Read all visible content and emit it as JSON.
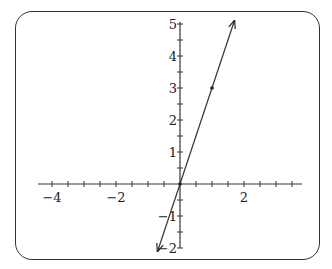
{
  "chart_data": {
    "type": "line",
    "title": "",
    "xlabel": "",
    "ylabel": "",
    "xlim": [
      -4.5,
      3.75
    ],
    "ylim": [
      -2.1,
      5.1
    ],
    "grid": false,
    "x_tick_labels": [
      "-4",
      "-2",
      "2"
    ],
    "y_tick_labels": [
      "5",
      "4",
      "3",
      "2",
      "1",
      "-1",
      "-2"
    ],
    "minor_tick_step": 0.5,
    "series": [
      {
        "name": "y = 3x",
        "equation": "y = 3x",
        "slope": 3,
        "intercept": 0,
        "x": [
          -0.7,
          1.7
        ],
        "y": [
          -2.1,
          5.1
        ],
        "arrows_both_ends": true
      }
    ],
    "points": [
      {
        "x": 0,
        "y": 0
      },
      {
        "x": 1,
        "y": 3
      }
    ],
    "legend": null
  },
  "labels": {
    "x": [
      {
        "text": "−4",
        "value": -4
      },
      {
        "text": "−2",
        "value": -2
      },
      {
        "text": "2",
        "value": 2
      }
    ],
    "y": [
      {
        "text": "5",
        "value": 5
      },
      {
        "text": "4",
        "value": 4
      },
      {
        "text": "3",
        "value": 3
      },
      {
        "text": "2",
        "value": 2
      },
      {
        "text": "1",
        "value": 1
      },
      {
        "text": "−1",
        "value": -1
      },
      {
        "text": "−2",
        "value": -2
      }
    ]
  }
}
